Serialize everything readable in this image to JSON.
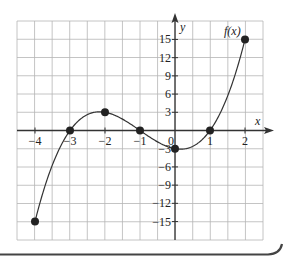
{
  "chart_data": {
    "type": "line",
    "title": "",
    "function_label": "f(x)",
    "xlabel": "x",
    "ylabel": "y",
    "xlim": [
      -4.5,
      2.5
    ],
    "ylim": [
      -18,
      18
    ],
    "x_ticks": [
      -4,
      -3,
      -2,
      -1,
      0,
      1,
      2
    ],
    "x_tick_labels": [
      "−4",
      "−3",
      "−2",
      "−1",
      "0",
      "1",
      "2"
    ],
    "y_ticks": [
      15,
      12,
      9,
      6,
      3,
      -3,
      -6,
      -9,
      -12,
      -15
    ],
    "y_tick_labels": [
      "15",
      "12",
      "9",
      "6",
      "3",
      "−3",
      "−6",
      "−9",
      "−12",
      "−15"
    ],
    "grid": true,
    "series": [
      {
        "name": "f(x)",
        "x": [
          -4,
          -3,
          -2,
          -1,
          0,
          1,
          2
        ],
        "values": [
          -15,
          0,
          3,
          0,
          -3,
          0,
          15
        ]
      }
    ],
    "marked_points": [
      {
        "x": -4,
        "y": -15
      },
      {
        "x": -3,
        "y": 0
      },
      {
        "x": -2,
        "y": 3
      },
      {
        "x": -1,
        "y": 0
      },
      {
        "x": 0,
        "y": -3
      },
      {
        "x": 1,
        "y": 0
      },
      {
        "x": 2,
        "y": 15
      }
    ],
    "colors": {
      "grid": "#b5b5b5",
      "axis": "#333333",
      "curve": "#333333",
      "frame": "#444444"
    }
  }
}
